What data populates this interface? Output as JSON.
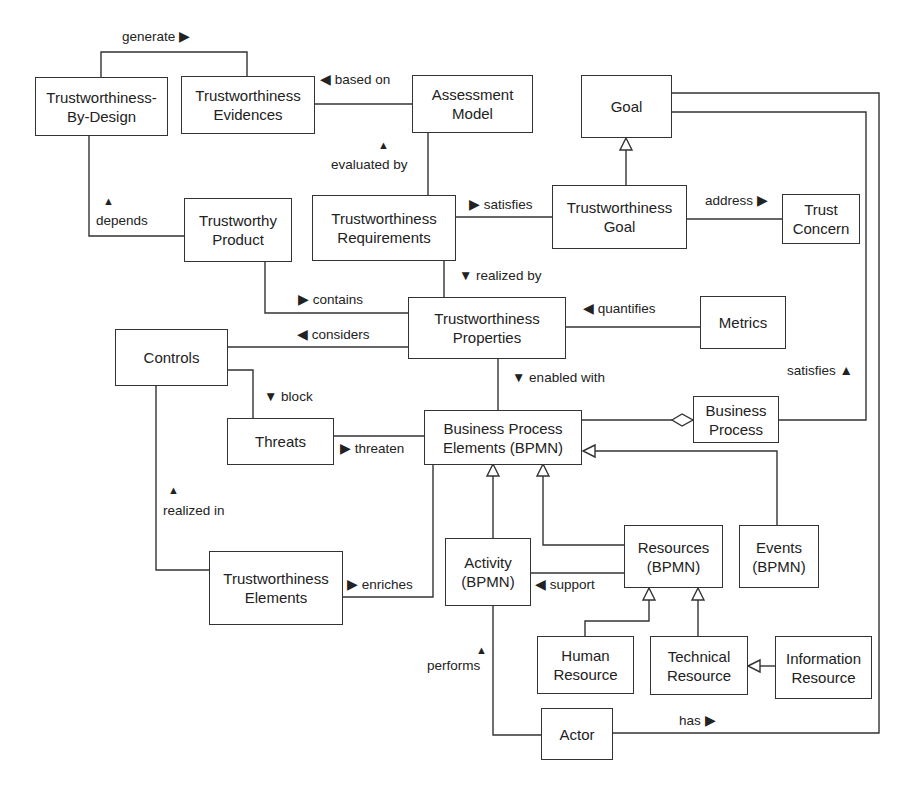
{
  "diagram": {
    "nodes": [
      {
        "id": "tbd",
        "label": "Trustworthiness-\nBy-Design"
      },
      {
        "id": "tev",
        "label": "Trustworthiness\nEvidences"
      },
      {
        "id": "am",
        "label": "Assessment\nModel"
      },
      {
        "id": "goal",
        "label": "Goal"
      },
      {
        "id": "tp",
        "label": "Trustworthy\nProduct"
      },
      {
        "id": "treq",
        "label": "Trustworthiness\nRequirements"
      },
      {
        "id": "tgoal",
        "label": "Trustworthiness\nGoal"
      },
      {
        "id": "tc",
        "label": "Trust\nConcern"
      },
      {
        "id": "tprop",
        "label": "Trustworthiness\nProperties"
      },
      {
        "id": "metrics",
        "label": "Metrics"
      },
      {
        "id": "controls",
        "label": "Controls"
      },
      {
        "id": "threats",
        "label": "Threats"
      },
      {
        "id": "bpe",
        "label": "Business Process\nElements (BPMN)"
      },
      {
        "id": "bp",
        "label": "Business\nProcess"
      },
      {
        "id": "telem",
        "label": "Trustworthiness\nElements"
      },
      {
        "id": "activity",
        "label": "Activity\n(BPMN)"
      },
      {
        "id": "resources",
        "label": "Resources\n(BPMN)"
      },
      {
        "id": "events",
        "label": "Events\n(BPMN)"
      },
      {
        "id": "hr",
        "label": "Human\nResource"
      },
      {
        "id": "tr",
        "label": "Technical\nResource"
      },
      {
        "id": "ir",
        "label": "Information\nResource"
      },
      {
        "id": "actor",
        "label": "Actor"
      }
    ],
    "edge_labels": {
      "generate": "generate ▶",
      "based_on": "◀ based on",
      "evaluated_by": "evaluated by",
      "depends": "depends",
      "satisfies_req": "▶ satisfies",
      "address": "address ▶",
      "realized_by": "▼ realized by",
      "contains": "▶ contains",
      "considers": "◀ considers",
      "quantifies": "◀ quantifies",
      "enabled_with": "▼ enabled with",
      "satisfies_bp": "satisfies ▲",
      "block": "▼ block",
      "threaten": "▶ threaten",
      "realized_in": "realized in",
      "enriches": "▶ enriches",
      "support": "◀ support",
      "performs": "performs",
      "has": "has ▶",
      "up_arrow": "▲"
    }
  }
}
